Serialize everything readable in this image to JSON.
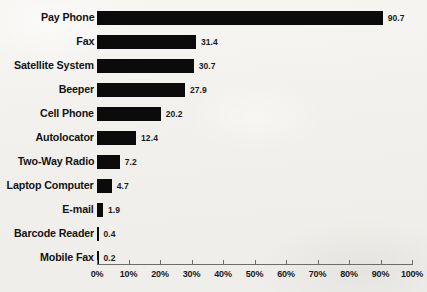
{
  "chart_data": {
    "type": "bar",
    "orientation": "horizontal",
    "title": "",
    "subtitle": "",
    "xlabel": "",
    "ylabel": "",
    "xlim": [
      0,
      100
    ],
    "grid": false,
    "legend": null,
    "categories": [
      "Pay Phone",
      "Fax",
      "Satellite System",
      "Beeper",
      "Cell Phone",
      "Autolocator",
      "Two-Way Radio",
      "Laptop Computer",
      "E-mail",
      "Barcode Reader",
      "Mobile Fax"
    ],
    "values": [
      90.7,
      31.4,
      30.7,
      27.9,
      20.2,
      12.4,
      7.2,
      4.7,
      1.9,
      0.4,
      0.2
    ],
    "value_labels": [
      "90.7",
      "31.4",
      "30.7",
      "27.9",
      "20.2",
      "12.4",
      "7.2",
      "4.7",
      "1.9",
      "0.4",
      "0.2"
    ],
    "x_ticks": [
      0,
      10,
      20,
      30,
      40,
      50,
      60,
      70,
      80,
      90,
      100
    ],
    "x_tick_labels": [
      "0%",
      "10%",
      "20%",
      "30%",
      "40%",
      "50%",
      "60%",
      "70%",
      "80%",
      "90%",
      "100%"
    ],
    "bar_color": "#0b0b0b",
    "axis_color": "#6c6c6c",
    "background_color": "#f4f3f0",
    "text_color": "#131313"
  }
}
